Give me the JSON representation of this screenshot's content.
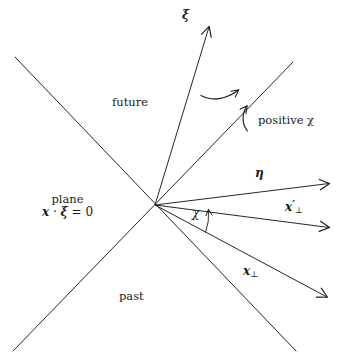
{
  "figure": {
    "width": 350,
    "height": 364,
    "background": "#ffffff",
    "stroke_color": "#1a1a1a",
    "text_color": "#1a1a1a"
  },
  "labels": {
    "xi": "ξ",
    "eta": "η",
    "future": "future",
    "past": "past",
    "plane_line1": "plane",
    "plane_line2_x": "x",
    "plane_line2_dot": " · ",
    "plane_line2_xi": "ξ",
    "plane_line2_eq": " = 0",
    "positive_chi": "positive χ",
    "chi": "χ",
    "x_perp": "x",
    "x_perp_sub": "⊥",
    "x_perp_prime": "x",
    "x_perp_prime_mark": "′",
    "x_perp_prime_sub": "⊥"
  },
  "geometry": {
    "origin": {
      "x": 155,
      "y": 205
    },
    "cone_lines": [
      {
        "name": "cone-line-upper-left-to-lower-right",
        "x1": 15,
        "y1": 57,
        "x2": 296,
        "y2": 351
      },
      {
        "name": "cone-line-upper-right-to-lower-left",
        "x1": 293,
        "y1": 62,
        "x2": 13,
        "y2": 351
      }
    ],
    "vectors": [
      {
        "name": "xi-vector",
        "label": "ξ",
        "x1": 155,
        "y1": 205,
        "x2": 209,
        "y2": 23
      },
      {
        "name": "eta-vector",
        "label": "η",
        "x1": 155,
        "y1": 205,
        "x2": 333,
        "y2": 183
      },
      {
        "name": "x-perp-prime-vector",
        "label": "x′⊥",
        "x1": 155,
        "y1": 205,
        "x2": 333,
        "y2": 228
      },
      {
        "name": "x-perp-vector",
        "label": "x⊥",
        "x1": 155,
        "y1": 205,
        "x2": 331,
        "y2": 299
      }
    ],
    "angle_arc": {
      "name": "chi-angle-arc",
      "center_x": 155,
      "center_y": 205,
      "radius": 52
    }
  }
}
